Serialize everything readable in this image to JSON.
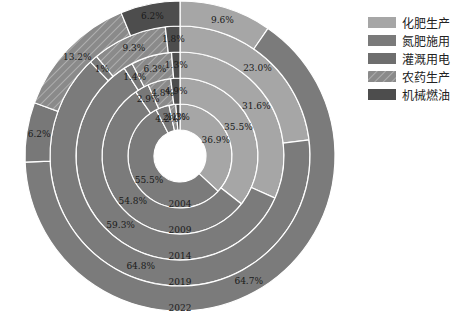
{
  "chart_data": {
    "type": "pie",
    "subtype": "nested-donut",
    "title": "",
    "categories": [
      "化肥生产",
      "灌溉用电",
      "氮肥施用",
      "农药生产",
      "机械燃油"
    ],
    "rings": [
      "2004",
      "2009",
      "2014",
      "2019",
      "2022"
    ],
    "series": [
      {
        "name": "2004",
        "values": [
          36.9,
          55.5,
          4.2,
          2.1,
          1.3
        ]
      },
      {
        "name": "2009",
        "values": [
          35.5,
          54.8,
          2.9,
          4.8,
          1.9
        ]
      },
      {
        "name": "2014",
        "values": [
          31.6,
          59.3,
          1.4,
          6.3,
          1.3
        ]
      },
      {
        "name": "2019",
        "values": [
          23.0,
          64.8,
          1.0,
          9.3,
          1.8
        ]
      },
      {
        "name": "2022",
        "values": [
          9.6,
          64.7,
          6.2,
          13.2,
          6.2
        ]
      }
    ],
    "labels": [
      [
        "36.9%",
        "55.5%",
        "4.2%",
        "2.1%",
        "1.3%"
      ],
      [
        "35.5%",
        "54.8%",
        "2.9%",
        "4.8%",
        "4.9%"
      ],
      [
        "31.6%",
        "59.3%",
        "1.4%",
        "6.3%",
        "1.3%"
      ],
      [
        "23.0%",
        "64.8%",
        "1%",
        "9.3%",
        "1.8%"
      ],
      [
        "9.6%",
        "64.7%",
        "6.2%",
        "13.2%",
        "6.2%"
      ]
    ],
    "colors": {
      "化肥生产": "#a6a6a6",
      "氮肥施用": "#7a7a7a",
      "灌溉用电": "#7d7d7d",
      "农药生产": "#8c8c8c",
      "机械燃油": "#4d4d4d"
    },
    "legend_position": "top-right",
    "start_angle": "12 o'clock, clockwise"
  },
  "legend": [
    {
      "label": "化肥生产",
      "color": "#a6a6a6",
      "pattern": "solid"
    },
    {
      "label": "氮肥施用",
      "color": "#7a7a7a",
      "pattern": "solid"
    },
    {
      "label": "灌溉用电",
      "color": "#6e6e6e",
      "pattern": "solid"
    },
    {
      "label": "农药生产",
      "color": "#8c8c8c",
      "pattern": "hatch"
    },
    {
      "label": "机械燃油",
      "color": "#4d4d4d",
      "pattern": "solid"
    }
  ]
}
